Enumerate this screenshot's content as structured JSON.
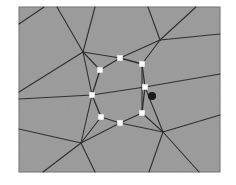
{
  "figure": {
    "title": "Polygonal mesh with central vertex ring",
    "caption": "",
    "panel": {
      "x": 19,
      "y": 7,
      "width": 201,
      "height": 165,
      "fill_color": "#9a9a9a",
      "border_color": "#6e6e6e"
    },
    "background_color": "#ffffff",
    "edge_color": "#2a2a2a",
    "edge_width": 1.1,
    "ring_edge_width": 1.3
  },
  "legend": {
    "ring_node_label": "ring vertex",
    "ring_node_color": "#ffffff",
    "marked_node_label": "marked vertex",
    "marked_node_color": "#141414",
    "junction_label": "mesh junction"
  },
  "chart_data": {
    "type": "diagram",
    "title": "Polygonal mesh with central vertex ring",
    "xlabel": "",
    "ylabel": "",
    "xlim": [
      19,
      220
    ],
    "ylim": [
      7,
      172
    ],
    "grid": false,
    "legend_position": "none",
    "ring_nodes": [
      {
        "id": "r1",
        "x": 120,
        "y": 58
      },
      {
        "id": "r2",
        "x": 142,
        "y": 64
      },
      {
        "id": "r3",
        "x": 145,
        "y": 87
      },
      {
        "id": "r4",
        "x": 142,
        "y": 113
      },
      {
        "id": "r5",
        "x": 120,
        "y": 123
      },
      {
        "id": "r6",
        "x": 101,
        "y": 117
      },
      {
        "id": "r7",
        "x": 92,
        "y": 95
      },
      {
        "id": "r8",
        "x": 100,
        "y": 70
      }
    ],
    "marked_nodes": [
      {
        "id": "m1",
        "x": 152,
        "y": 96
      }
    ],
    "junction_nodes": [
      {
        "id": "j1",
        "x": 83,
        "y": 52
      },
      {
        "id": "j2",
        "x": 160,
        "y": 40
      },
      {
        "id": "j3",
        "x": 81,
        "y": 143
      },
      {
        "id": "j4",
        "x": 163,
        "y": 132
      }
    ],
    "ring_edges": [
      [
        "r1",
        "r2"
      ],
      [
        "r2",
        "r3"
      ],
      [
        "r3",
        "r4"
      ],
      [
        "r4",
        "r5"
      ],
      [
        "r5",
        "r6"
      ],
      [
        "r6",
        "r7"
      ],
      [
        "r7",
        "r8"
      ],
      [
        "r8",
        "r1"
      ]
    ],
    "spoke_edges": [
      [
        "r1",
        "j1"
      ],
      [
        "r8",
        "j1"
      ],
      [
        "r7",
        "j1"
      ],
      [
        "r2",
        "j2"
      ],
      [
        "r1",
        "j2"
      ],
      [
        "r6",
        "j3"
      ],
      [
        "r7",
        "j3"
      ],
      [
        "r5",
        "j3"
      ],
      [
        "r4",
        "j4"
      ],
      [
        "r5",
        "j4"
      ],
      [
        "r3",
        "j4"
      ],
      [
        "r2",
        "r4"
      ],
      [
        "r7",
        "r3"
      ]
    ],
    "outer_edges": [
      {
        "from": [
          83,
          52
        ],
        "to": [
          19,
          92
        ]
      },
      {
        "from": [
          83,
          52
        ],
        "to": [
          57,
          7
        ]
      },
      {
        "from": [
          83,
          52
        ],
        "to": [
          95,
          7
        ]
      },
      {
        "from": [
          160,
          40
        ],
        "to": [
          148,
          7
        ]
      },
      {
        "from": [
          160,
          40
        ],
        "to": [
          220,
          34
        ]
      },
      {
        "from": [
          160,
          40
        ],
        "to": [
          196,
          7
        ]
      },
      {
        "from": [
          81,
          143
        ],
        "to": [
          19,
          129
        ]
      },
      {
        "from": [
          81,
          143
        ],
        "to": [
          43,
          172
        ]
      },
      {
        "from": [
          81,
          143
        ],
        "to": [
          95,
          172
        ]
      },
      {
        "from": [
          163,
          132
        ],
        "to": [
          220,
          115
        ]
      },
      {
        "from": [
          163,
          132
        ],
        "to": [
          149,
          172
        ]
      },
      {
        "from": [
          163,
          132
        ],
        "to": [
          199,
          172
        ]
      },
      {
        "from": [
          145,
          87
        ],
        "to": [
          220,
          74
        ]
      },
      {
        "from": [
          92,
          95
        ],
        "to": [
          19,
          99
        ]
      },
      {
        "from": [
          19,
          24
        ],
        "to": [
          44,
          7
        ]
      }
    ]
  }
}
